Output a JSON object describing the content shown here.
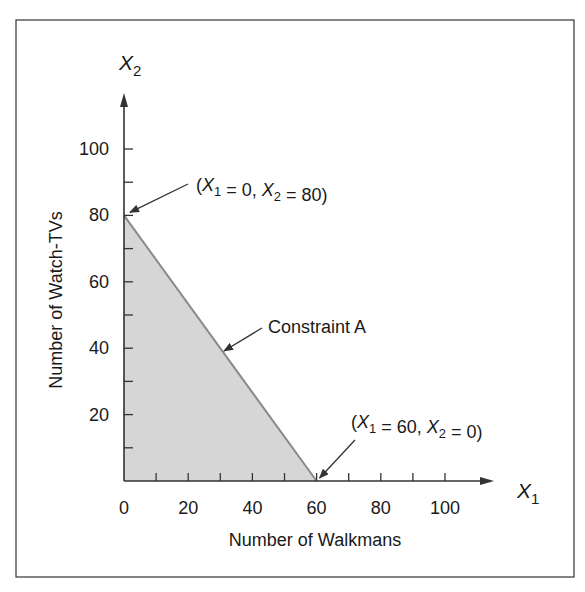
{
  "chart_data": {
    "type": "area",
    "title": "",
    "xlabel": "Number of Walkmans",
    "ylabel": "Number of Watch-TVs",
    "x_axis_symbol": {
      "base": "X",
      "sub": "1"
    },
    "y_axis_symbol": {
      "base": "X",
      "sub": "2"
    },
    "xlim": [
      0,
      115
    ],
    "ylim": [
      0,
      115
    ],
    "x_ticks": [
      0,
      10,
      20,
      30,
      40,
      50,
      60,
      70,
      80,
      90,
      100
    ],
    "x_tick_labels": [
      "0",
      "20",
      "40",
      "60",
      "80",
      "100"
    ],
    "x_tick_label_values": [
      0,
      20,
      40,
      60,
      80,
      100
    ],
    "y_ticks": [
      10,
      20,
      30,
      40,
      50,
      60,
      70,
      80,
      90,
      100
    ],
    "y_tick_labels": [
      "20",
      "40",
      "60",
      "80",
      "100"
    ],
    "y_tick_label_values": [
      20,
      40,
      60,
      80,
      100
    ],
    "grid": false,
    "legend": null,
    "series": [
      {
        "name": "Constraint A",
        "type": "line",
        "x": [
          0,
          60
        ],
        "y": [
          80,
          0
        ],
        "color": "#8a8a8a"
      },
      {
        "name": "Feasible region",
        "type": "area",
        "polygon": [
          [
            0,
            0
          ],
          [
            0,
            80
          ],
          [
            60,
            0
          ]
        ],
        "color": "#d6d6d6"
      }
    ],
    "annotations": [
      {
        "id": "top",
        "text_parts": [
          [
            "(",
            ""
          ],
          [
            "X",
            "1"
          ],
          [
            " = 0, ",
            ""
          ],
          [
            "X",
            "2"
          ],
          [
            " = 80)",
            ""
          ]
        ],
        "point": [
          0,
          80
        ]
      },
      {
        "id": "line",
        "text": "Constraint A",
        "point": [
          30,
          40
        ]
      },
      {
        "id": "bottom",
        "text_parts": [
          [
            "(",
            ""
          ],
          [
            "X",
            "1"
          ],
          [
            " = 60, ",
            ""
          ],
          [
            "X",
            "2"
          ],
          [
            " = 0)",
            ""
          ]
        ],
        "point": [
          60,
          0
        ]
      }
    ]
  },
  "labels": {
    "xlabel": "Number of Walkmans",
    "ylabel": "Number of Watch-TVs",
    "constraint": "Constraint A",
    "annot_top": "(X1 = 0, X2 = 80)",
    "annot_bottom": "(X1 = 60, X2 = 0)"
  },
  "colors": {
    "frame": "#333333",
    "axis": "#333333",
    "fill": "#d6d6d6",
    "constraint_line": "#8a8a8a",
    "text": "#1a1a1a"
  }
}
